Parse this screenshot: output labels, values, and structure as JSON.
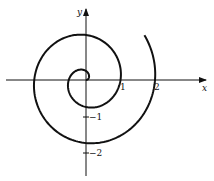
{
  "chart_data": {
    "type": "line",
    "title": "",
    "equation": "r = θ/(2π)",
    "theta_range": [
      0,
      13.2
    ],
    "xlabel": "x",
    "ylabel": "y",
    "x_ticks": [
      {
        "value": 1,
        "label": "1"
      },
      {
        "value": 2,
        "label": "2"
      }
    ],
    "y_ticks": [
      {
        "value": -1,
        "label": "−1"
      },
      {
        "value": -2,
        "label": "−2"
      }
    ],
    "axis_crossings": {
      "positive_x": [
        1,
        2
      ],
      "negative_x": [
        0.5,
        1.5
      ],
      "negative_y": [
        0.75,
        1.75
      ],
      "positive_y": [
        0.25,
        1.25
      ]
    },
    "grid": false,
    "legend": null
  },
  "labels": {
    "x_axis": "x",
    "y_axis": "y",
    "tick_x1": "1",
    "tick_x2": "2",
    "tick_ym1": "−1",
    "tick_ym2": "−2"
  },
  "colors": {
    "stroke": "#111111",
    "background": "#ffffff"
  }
}
